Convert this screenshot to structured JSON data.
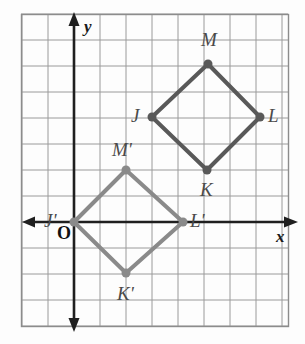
{
  "figure": {
    "type": "coordinate-plane-transformation-diagram",
    "grid": {
      "origin_px": [
        74,
        222
      ],
      "spacing_px": 26,
      "frame_px": [
        21,
        14,
        288,
        326
      ],
      "x_range": [
        -2,
        8
      ],
      "y_range": [
        -4,
        8
      ],
      "grid_visible": true,
      "grid_color": "#9a9a9a",
      "frame_color": "#8c8c8c"
    },
    "axes": {
      "x_label": "x",
      "y_label": "y",
      "origin_label": "O",
      "color": "#1f1f1f",
      "x_axis_y_px": 222,
      "y_axis_x_px": 74
    },
    "shapes": [
      {
        "name": "quadrilateral-JKLM",
        "color": "#595959",
        "stroke_width": 4,
        "vertices": [
          {
            "label": "J",
            "x": 3,
            "y": 4,
            "px": [
              152,
              117
            ],
            "label_px": [
              131,
              106
            ],
            "prime": false
          },
          {
            "label": "K",
            "x": 5,
            "y": 2,
            "px": [
              207,
              170
            ],
            "label_px": [
              200,
              180
            ],
            "prime": false
          },
          {
            "label": "L",
            "x": 7,
            "y": 4,
            "px": [
              260,
              117
            ],
            "label_px": [
              268,
              106
            ],
            "prime": false
          },
          {
            "label": "M",
            "x": 5,
            "y": 6,
            "px": [
              208,
              64
            ],
            "label_px": [
              201,
              30
            ],
            "prime": false
          }
        ]
      },
      {
        "name": "quadrilateral-JKLM-prime",
        "color": "#8a8a8a",
        "stroke_width": 4,
        "vertices": [
          {
            "label": "J'",
            "x": 0,
            "y": 0,
            "px": [
              74,
              222
            ],
            "label_px": [
              44,
              211
            ],
            "prime": true
          },
          {
            "label": "K'",
            "x": 2,
            "y": -2,
            "px": [
              126,
              273
            ],
            "label_px": [
              117,
              284
            ],
            "prime": true
          },
          {
            "label": "L'",
            "x": 4,
            "y": 0,
            "px": [
              183,
              222
            ],
            "label_px": [
              190,
              211
            ],
            "prime": true
          },
          {
            "label": "M'",
            "x": 2,
            "y": 2,
            "px": [
              126,
              170
            ],
            "label_px": [
              112,
              140
            ],
            "prime": true
          }
        ]
      }
    ],
    "vertex_dot_radius": 4.5
  }
}
